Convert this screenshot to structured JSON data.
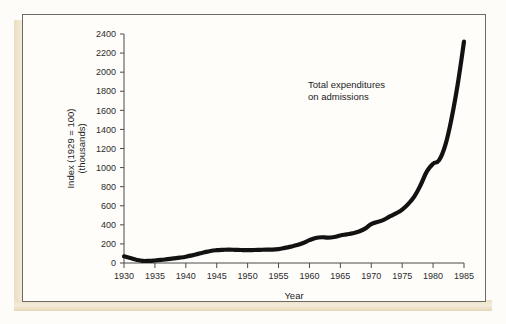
{
  "figure": {
    "annotation": "Total  expenditures\non admissions",
    "annotation_line1": "Total  expenditures",
    "annotation_line2": "on admissions",
    "ylabel_line1": "Index  (1929  =  100)",
    "ylabel_line2": "(thousands)",
    "xlabel": "Year",
    "line_color": "#121212",
    "axis_color": "#4a4a4a",
    "paper_color": "#fefdfa",
    "edge_color": "#ece1c8"
  },
  "chart_data": {
    "type": "line",
    "title": "",
    "xlabel": "Year",
    "ylabel": "Index (1929 = 100) (thousands)",
    "annotations": [
      "Total  expenditures on admissions"
    ],
    "grid": false,
    "legend_position": "none",
    "xlim": [
      1930,
      1985
    ],
    "ylim": [
      0,
      2400
    ],
    "xticks": [
      1930,
      1935,
      1940,
      1945,
      1950,
      1955,
      1960,
      1965,
      1970,
      1975,
      1980,
      1985
    ],
    "xtick_labels": [
      "1930",
      "1935",
      "1940",
      "1945",
      "1950",
      "1955",
      "1960",
      "1965",
      "1970",
      "1975",
      "1980",
      "1985"
    ],
    "yticks": [
      0,
      200,
      400,
      600,
      800,
      1000,
      1200,
      1400,
      1600,
      1800,
      2000,
      2200,
      2400
    ],
    "ytick_labels": [
      "0",
      "200",
      "400",
      "600",
      "800",
      "1000",
      "1200",
      "1400",
      "1600",
      "1800",
      "2000",
      "2200",
      "2400"
    ],
    "series": [
      {
        "name": "Total expenditures on admissions",
        "x": [
          1930,
          1931,
          1932,
          1933,
          1934,
          1935,
          1936,
          1937,
          1938,
          1939,
          1940,
          1941,
          1942,
          1943,
          1944,
          1945,
          1946,
          1947,
          1948,
          1949,
          1950,
          1951,
          1952,
          1953,
          1954,
          1955,
          1956,
          1957,
          1958,
          1959,
          1960,
          1961,
          1962,
          1963,
          1964,
          1965,
          1966,
          1967,
          1968,
          1969,
          1970,
          1971,
          1972,
          1973,
          1974,
          1975,
          1976,
          1977,
          1978,
          1979,
          1980,
          1981,
          1982,
          1983,
          1984,
          1985
        ],
        "y": [
          70,
          52,
          34,
          22,
          22,
          26,
          32,
          40,
          48,
          56,
          66,
          80,
          96,
          112,
          126,
          134,
          138,
          140,
          138,
          136,
          135,
          136,
          138,
          140,
          140,
          146,
          158,
          172,
          188,
          210,
          240,
          262,
          270,
          266,
          272,
          288,
          300,
          312,
          330,
          360,
          408,
          430,
          452,
          488,
          520,
          560,
          620,
          700,
          820,
          960,
          1040,
          1080,
          1240,
          1520,
          1880,
          2320
        ]
      }
    ]
  }
}
